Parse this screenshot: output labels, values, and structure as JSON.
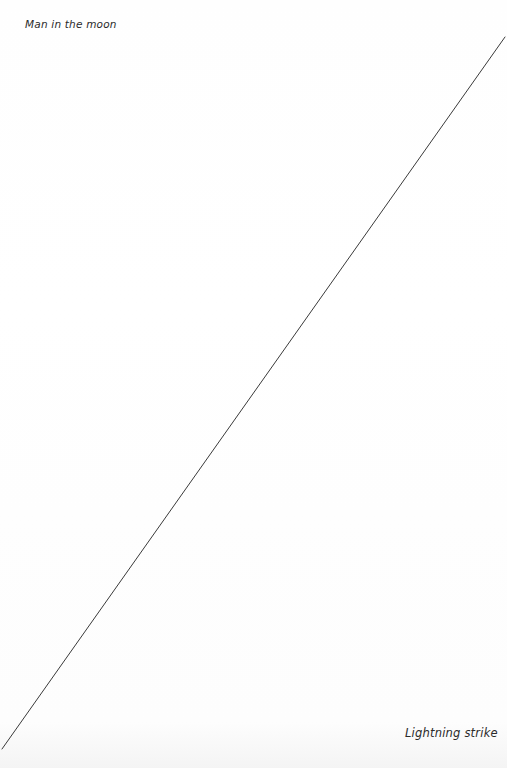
{
  "diagram": {
    "labels": {
      "top_left": "Man in the moon",
      "bottom_right": "Lightning strike"
    },
    "line": {
      "x1": 505,
      "y1": 37,
      "x2": 2,
      "y2": 749,
      "color": "#3a3a3a",
      "width": 1
    },
    "background_color": "#ffffff",
    "text_color": "#2a2a2a"
  }
}
